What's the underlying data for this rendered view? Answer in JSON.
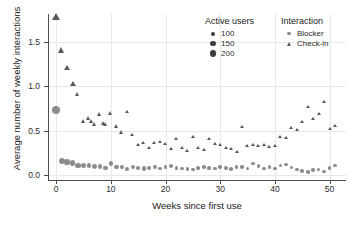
{
  "chart_data": {
    "type": "scatter",
    "title": "",
    "xlabel": "Weeks since first use",
    "ylabel": "Average number of weekly interactions",
    "xlim": [
      -1.5,
      53
    ],
    "ylim": [
      -0.06,
      1.82
    ],
    "xticks": [
      0,
      10,
      20,
      30,
      40,
      50
    ],
    "yticks": [
      0.0,
      0.5,
      1.0,
      1.5
    ],
    "xticklabels": [
      "0",
      "10",
      "20",
      "30",
      "40",
      "50"
    ],
    "yticklabels": [
      "0.0",
      "0.5",
      "1.0",
      "1.5"
    ],
    "grid": true,
    "legend_position": "top-right",
    "size_legend": {
      "title": "Active users",
      "entries": [
        {
          "label": "100",
          "value": 100,
          "px": 4.0
        },
        {
          "label": "150",
          "value": 150,
          "px": 5.2
        },
        {
          "label": "200",
          "value": 200,
          "px": 6.4
        }
      ]
    },
    "shape_legend": {
      "title": "Interaction",
      "entries": [
        {
          "label": "Blocker",
          "marker": "circle",
          "color": "#8c8c8c"
        },
        {
          "label": "Check-in",
          "marker": "triangle",
          "color": "#595959"
        }
      ]
    },
    "series": [
      {
        "name": "Check-in",
        "marker": "triangle",
        "color": "#595959",
        "points": [
          {
            "x": 0,
            "y": 1.78,
            "size": 205
          },
          {
            "x": 1,
            "y": 1.4,
            "size": 160
          },
          {
            "x": 2,
            "y": 1.2,
            "size": 150
          },
          {
            "x": 3,
            "y": 1.02,
            "size": 140
          },
          {
            "x": 4,
            "y": 0.9,
            "size": 130
          },
          {
            "x": 5,
            "y": 0.6,
            "size": 125
          },
          {
            "x": 6,
            "y": 0.63,
            "size": 125
          },
          {
            "x": 6.5,
            "y": 0.6,
            "size": 120
          },
          {
            "x": 7,
            "y": 0.57,
            "size": 120
          },
          {
            "x": 8,
            "y": 0.68,
            "size": 120
          },
          {
            "x": 8.6,
            "y": 0.58,
            "size": 115
          },
          {
            "x": 9,
            "y": 0.57,
            "size": 115
          },
          {
            "x": 10,
            "y": 0.69,
            "size": 115
          },
          {
            "x": 11,
            "y": 0.55,
            "size": 112
          },
          {
            "x": 12,
            "y": 0.48,
            "size": 112
          },
          {
            "x": 13,
            "y": 0.7,
            "size": 110
          },
          {
            "x": 14,
            "y": 0.44,
            "size": 110
          },
          {
            "x": 15,
            "y": 0.33,
            "size": 108
          },
          {
            "x": 16,
            "y": 0.35,
            "size": 108
          },
          {
            "x": 17,
            "y": 0.3,
            "size": 106
          },
          {
            "x": 18,
            "y": 0.36,
            "size": 106
          },
          {
            "x": 19,
            "y": 0.37,
            "size": 105
          },
          {
            "x": 20,
            "y": 0.34,
            "size": 105
          },
          {
            "x": 21,
            "y": 0.29,
            "size": 104
          },
          {
            "x": 22,
            "y": 0.4,
            "size": 104
          },
          {
            "x": 23,
            "y": 0.3,
            "size": 103
          },
          {
            "x": 24,
            "y": 0.26,
            "size": 103
          },
          {
            "x": 25,
            "y": 0.42,
            "size": 102
          },
          {
            "x": 26,
            "y": 0.3,
            "size": 102
          },
          {
            "x": 27,
            "y": 0.28,
            "size": 101
          },
          {
            "x": 28,
            "y": 0.4,
            "size": 101
          },
          {
            "x": 29,
            "y": 0.34,
            "size": 100
          },
          {
            "x": 30,
            "y": 0.33,
            "size": 100
          },
          {
            "x": 31,
            "y": 0.3,
            "size": 100
          },
          {
            "x": 32,
            "y": 0.29,
            "size": 100
          },
          {
            "x": 33,
            "y": 0.25,
            "size": 100
          },
          {
            "x": 34,
            "y": 0.54,
            "size": 100
          },
          {
            "x": 35,
            "y": 0.32,
            "size": 100
          },
          {
            "x": 36,
            "y": 0.33,
            "size": 100
          },
          {
            "x": 37,
            "y": 0.32,
            "size": 100
          },
          {
            "x": 38,
            "y": 0.33,
            "size": 100
          },
          {
            "x": 39,
            "y": 0.31,
            "size": 100
          },
          {
            "x": 40,
            "y": 0.32,
            "size": 100
          },
          {
            "x": 41,
            "y": 0.43,
            "size": 100
          },
          {
            "x": 42,
            "y": 0.41,
            "size": 100
          },
          {
            "x": 43,
            "y": 0.53,
            "size": 100
          },
          {
            "x": 44,
            "y": 0.5,
            "size": 100
          },
          {
            "x": 45,
            "y": 0.6,
            "size": 100
          },
          {
            "x": 46,
            "y": 0.77,
            "size": 100
          },
          {
            "x": 47,
            "y": 0.63,
            "size": 100
          },
          {
            "x": 48,
            "y": 0.68,
            "size": 100
          },
          {
            "x": 49,
            "y": 0.82,
            "size": 100
          },
          {
            "x": 50,
            "y": 0.51,
            "size": 100
          },
          {
            "x": 51,
            "y": 0.55,
            "size": 100
          }
        ]
      },
      {
        "name": "Blocker",
        "marker": "circle",
        "color": "#8c8c8c",
        "points": [
          {
            "x": 0,
            "y": 0.73,
            "size": 200
          },
          {
            "x": 1,
            "y": 0.155,
            "size": 160
          },
          {
            "x": 2,
            "y": 0.14,
            "size": 150
          },
          {
            "x": 3,
            "y": 0.135,
            "size": 145
          },
          {
            "x": 4,
            "y": 0.105,
            "size": 140
          },
          {
            "x": 5,
            "y": 0.1,
            "size": 135
          },
          {
            "x": 6,
            "y": 0.1,
            "size": 130
          },
          {
            "x": 7,
            "y": 0.095,
            "size": 128
          },
          {
            "x": 8,
            "y": 0.095,
            "size": 126
          },
          {
            "x": 9,
            "y": 0.075,
            "size": 124
          },
          {
            "x": 10,
            "y": 0.125,
            "size": 122
          },
          {
            "x": 11,
            "y": 0.085,
            "size": 120
          },
          {
            "x": 12,
            "y": 0.09,
            "size": 118
          },
          {
            "x": 13,
            "y": 0.065,
            "size": 116
          },
          {
            "x": 14,
            "y": 0.085,
            "size": 114
          },
          {
            "x": 15,
            "y": 0.075,
            "size": 112
          },
          {
            "x": 16,
            "y": 0.07,
            "size": 110
          },
          {
            "x": 17,
            "y": 0.075,
            "size": 110
          },
          {
            "x": 18,
            "y": 0.085,
            "size": 108
          },
          {
            "x": 19,
            "y": 0.07,
            "size": 108
          },
          {
            "x": 20,
            "y": 0.085,
            "size": 106
          },
          {
            "x": 21,
            "y": 0.095,
            "size": 106
          },
          {
            "x": 22,
            "y": 0.08,
            "size": 105
          },
          {
            "x": 23,
            "y": 0.07,
            "size": 105
          },
          {
            "x": 24,
            "y": 0.065,
            "size": 104
          },
          {
            "x": 25,
            "y": 0.06,
            "size": 104
          },
          {
            "x": 26,
            "y": 0.08,
            "size": 103
          },
          {
            "x": 27,
            "y": 0.085,
            "size": 103
          },
          {
            "x": 28,
            "y": 0.075,
            "size": 102
          },
          {
            "x": 29,
            "y": 0.07,
            "size": 102
          },
          {
            "x": 30,
            "y": 0.09,
            "size": 101
          },
          {
            "x": 31,
            "y": 0.075,
            "size": 101
          },
          {
            "x": 32,
            "y": 0.065,
            "size": 100
          },
          {
            "x": 33,
            "y": 0.09,
            "size": 100
          },
          {
            "x": 34,
            "y": 0.09,
            "size": 100
          },
          {
            "x": 35,
            "y": 0.07,
            "size": 100
          },
          {
            "x": 36,
            "y": 0.125,
            "size": 100
          },
          {
            "x": 37,
            "y": 0.1,
            "size": 100
          },
          {
            "x": 38,
            "y": 0.07,
            "size": 100
          },
          {
            "x": 39,
            "y": 0.085,
            "size": 100
          },
          {
            "x": 40,
            "y": 0.07,
            "size": 100
          },
          {
            "x": 41,
            "y": 0.105,
            "size": 100
          },
          {
            "x": 42,
            "y": 0.115,
            "size": 100
          },
          {
            "x": 43,
            "y": 0.08,
            "size": 100
          },
          {
            "x": 44,
            "y": 0.06,
            "size": 100
          },
          {
            "x": 45,
            "y": 0.045,
            "size": 100
          },
          {
            "x": 46,
            "y": 0.03,
            "size": 100
          },
          {
            "x": 47,
            "y": 0.055,
            "size": 100
          },
          {
            "x": 48,
            "y": 0.06,
            "size": 100
          },
          {
            "x": 49,
            "y": 0.035,
            "size": 100
          },
          {
            "x": 50,
            "y": 0.075,
            "size": 100
          },
          {
            "x": 51,
            "y": 0.105,
            "size": 100
          }
        ]
      }
    ]
  }
}
